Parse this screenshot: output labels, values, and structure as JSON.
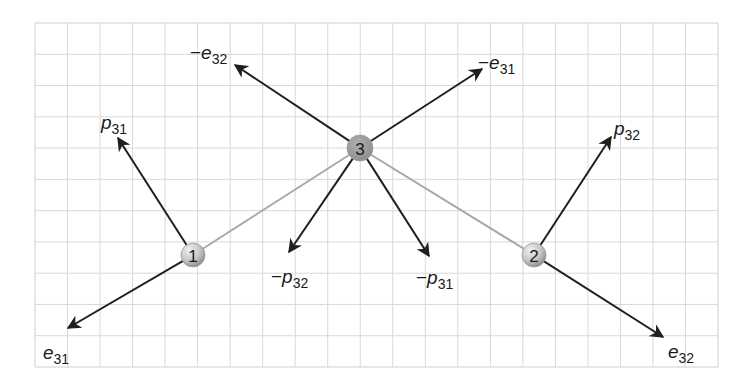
{
  "diagram": {
    "grid": {
      "left": 35,
      "top": 23,
      "right": 718,
      "bottom": 367,
      "cols": 21,
      "rows": 11,
      "line_color": "#d9d9d9",
      "border_color": "#cfcfcf"
    },
    "colors": {
      "arrow": "#1f1f1f",
      "link": "#a8a8a8",
      "node_fill_light": "#d0d0d0",
      "node_fill_dark": "#8f8f8f",
      "node3_fill": "#9a9a9a"
    },
    "nodes": [
      {
        "id": "1",
        "label": "1",
        "x": 193,
        "y": 255,
        "r": 12
      },
      {
        "id": "2",
        "label": "2",
        "x": 534,
        "y": 255,
        "r": 12
      },
      {
        "id": "3",
        "label": "3",
        "x": 360,
        "y": 148,
        "r": 13
      }
    ],
    "links": [
      {
        "from": "1",
        "to": "3"
      },
      {
        "from": "2",
        "to": "3"
      }
    ],
    "vectors": [
      {
        "name": "p31",
        "from": "1",
        "tip": [
          118,
          138
        ],
        "sign": "",
        "sym": "p",
        "sub": "31",
        "label_pos": [
          101,
          123
        ]
      },
      {
        "name": "e31",
        "from": "1",
        "tip": [
          68,
          328
        ],
        "sign": "",
        "sym": "e",
        "sub": "31",
        "label_pos": [
          43,
          353
        ]
      },
      {
        "name": "neg-e32",
        "from": "3",
        "tip": [
          235,
          65
        ],
        "sign": "−",
        "sym": "e",
        "sub": "32",
        "label_pos": [
          190,
          53
        ]
      },
      {
        "name": "neg-e31",
        "from": "3",
        "tip": [
          482,
          69
        ],
        "sign": "−",
        "sym": "e",
        "sub": "31",
        "label_pos": [
          478,
          63
        ]
      },
      {
        "name": "neg-p32",
        "from": "3",
        "tip": [
          289,
          252
        ],
        "sign": "−",
        "sym": "p",
        "sub": "32",
        "label_pos": [
          271,
          277
        ]
      },
      {
        "name": "neg-p31",
        "from": "3",
        "tip": [
          429,
          256
        ],
        "sign": "−",
        "sym": "p",
        "sub": "31",
        "label_pos": [
          416,
          278
        ]
      },
      {
        "name": "p32",
        "from": "2",
        "tip": [
          611,
          137
        ],
        "sign": "",
        "sym": "p",
        "sub": "32",
        "label_pos": [
          614,
          129
        ]
      },
      {
        "name": "e32",
        "from": "2",
        "tip": [
          663,
          337
        ],
        "sign": "",
        "sym": "e",
        "sub": "32",
        "label_pos": [
          668,
          352
        ]
      }
    ]
  }
}
